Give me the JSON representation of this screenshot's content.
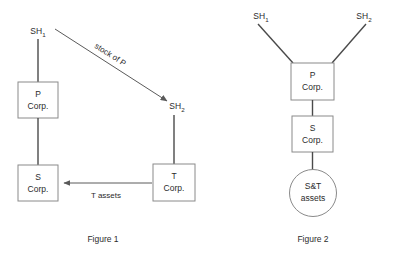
{
  "page": {
    "background_color": "#ffffff",
    "text_color": "#2b2b2b",
    "shape_stroke_color": "#8a8a8a",
    "connector_color": "#4a4a4a",
    "arrow_color": "#5a5a5a"
  },
  "figures": [
    {
      "id": "figure-1",
      "caption": "Figure 1",
      "nodes": {
        "sh1": {
          "label": "SH",
          "subscript": "1",
          "shape": "text"
        },
        "sh2": {
          "label": "SH",
          "subscript": "2",
          "shape": "text"
        },
        "p_corp_line1": "P",
        "p_corp_line2": "Corp.",
        "s_corp_line1": "S",
        "s_corp_line2": "Corp.",
        "t_corp_line1": "T",
        "t_corp_line2": "Corp."
      },
      "edges": {
        "stock_of_p": "stock of P",
        "t_assets": "T assets"
      }
    },
    {
      "id": "figure-2",
      "caption": "Figure 2",
      "nodes": {
        "sh1": {
          "label": "SH",
          "subscript": "1",
          "shape": "text"
        },
        "sh2": {
          "label": "SH",
          "subscript": "2",
          "shape": "text"
        },
        "p_corp_line1": "P",
        "p_corp_line2": "Corp.",
        "s_corp_line1": "S",
        "s_corp_line2": "Corp.",
        "assets_line1": "S&T",
        "assets_line2": "assets"
      }
    }
  ]
}
